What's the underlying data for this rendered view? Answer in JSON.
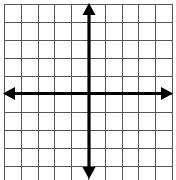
{
  "diagram": {
    "type": "coordinate-plane",
    "title": "",
    "columns": 10,
    "rows": 10,
    "grid_color": "#555555",
    "axis_color": "#000000",
    "background": "#ffffff",
    "x_axis": {
      "arrows": "both",
      "label": ""
    },
    "y_axis": {
      "arrows": "both",
      "label": ""
    },
    "tick_labels": []
  }
}
